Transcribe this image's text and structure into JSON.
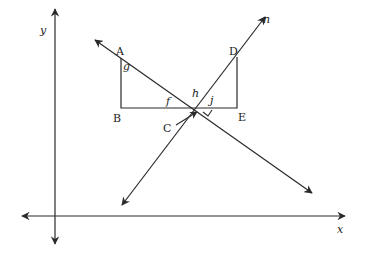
{
  "diagram": {
    "colors": {
      "line": "#2a2a2a",
      "background": "#ffffff"
    },
    "axes": {
      "x": {
        "label": "x",
        "y": 216,
        "from": 20,
        "to": 347
      },
      "y": {
        "label": "y",
        "x": 55,
        "from": 7,
        "to": 244
      }
    },
    "points": {
      "A": {
        "label": "A",
        "x": 121,
        "y": 58
      },
      "B": {
        "label": "B",
        "x": 121,
        "y": 108
      },
      "C": {
        "label": "C",
        "x": 166,
        "y": 128
      },
      "D": {
        "label": "D",
        "x": 237,
        "y": 57
      },
      "E": {
        "label": "E",
        "x": 237,
        "y": 108
      }
    },
    "intersection": {
      "x": 200,
      "y": 108
    },
    "angles": {
      "g": "g",
      "f": "f",
      "h": "h",
      "j": "j"
    },
    "lines": {
      "n": {
        "label": "n"
      }
    },
    "right_angle_marker": true
  }
}
